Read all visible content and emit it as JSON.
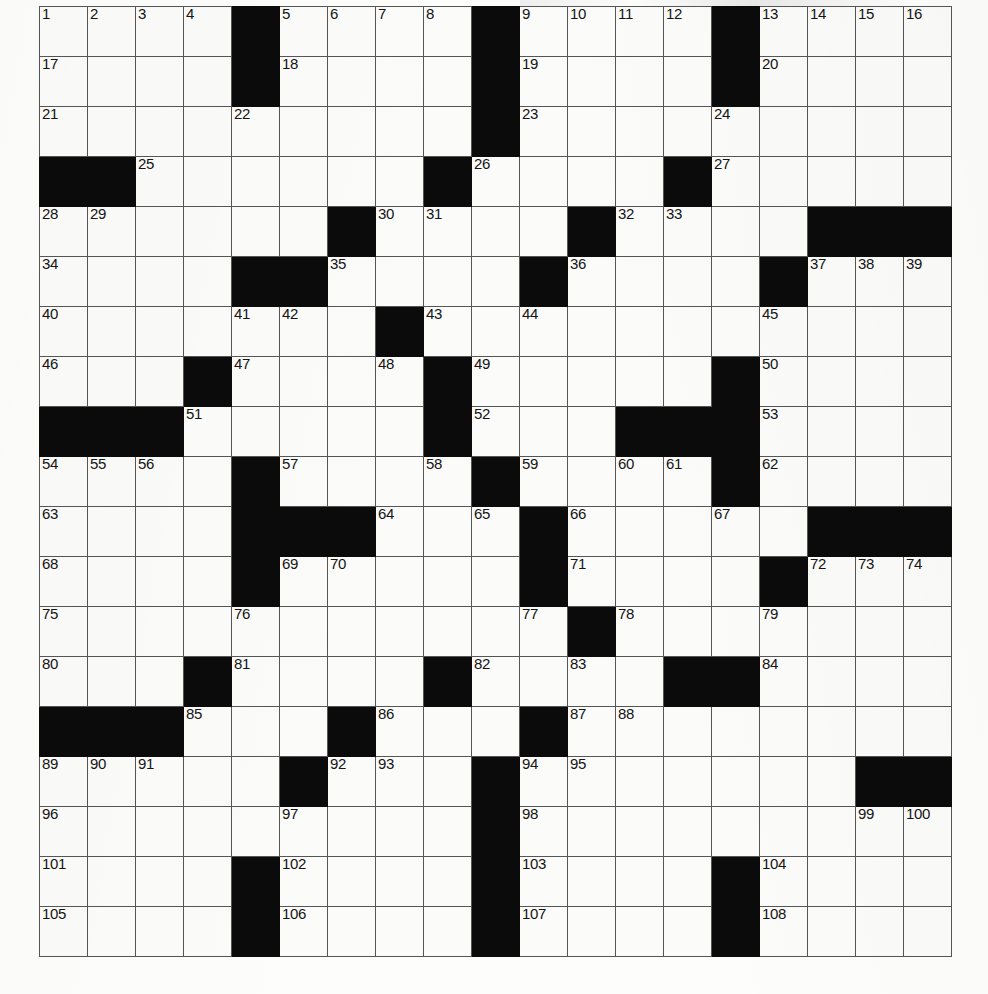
{
  "puzzle": {
    "type": "crossword-grid",
    "rows": 19,
    "columns": 19,
    "cell_count": 361,
    "colors": {
      "block": "#0b0b0b",
      "cell": "#fbfbf9",
      "grid_line": "#555555",
      "number_text": "#141414",
      "page": "#ffffff"
    },
    "highest_clue_number": 108,
    "grid": [
      [
        {
          "n": "1"
        },
        {
          "n": "2"
        },
        {
          "n": "3"
        },
        {
          "n": "4"
        },
        {
          "b": true
        },
        {
          "n": "5"
        },
        {
          "n": "6"
        },
        {
          "n": "7"
        },
        {
          "n": "8"
        },
        {
          "b": true
        },
        {
          "n": "9"
        },
        {
          "n": "10"
        },
        {
          "n": "11"
        },
        {
          "n": "12"
        },
        {
          "b": true
        },
        {
          "n": "13"
        },
        {
          "n": "14"
        },
        {
          "n": "15"
        },
        {
          "n": "16"
        }
      ],
      [
        {
          "n": "17"
        },
        {},
        {},
        {},
        {
          "b": true
        },
        {
          "n": "18"
        },
        {},
        {},
        {},
        {
          "b": true
        },
        {
          "n": "19"
        },
        {},
        {},
        {},
        {
          "b": true
        },
        {
          "n": "20"
        },
        {},
        {},
        {}
      ],
      [
        {
          "n": "21"
        },
        {},
        {},
        {},
        {
          "n": "22"
        },
        {},
        {},
        {},
        {},
        {
          "b": true
        },
        {
          "n": "23"
        },
        {},
        {},
        {},
        {
          "n": "24"
        },
        {},
        {},
        {},
        {}
      ],
      [
        {
          "b": true
        },
        {
          "b": true
        },
        {
          "n": "25"
        },
        {},
        {},
        {},
        {},
        {},
        {
          "b": true
        },
        {
          "n": "26"
        },
        {},
        {},
        {},
        {
          "b": true
        },
        {
          "n": "27"
        },
        {},
        {},
        {},
        {}
      ],
      [
        {
          "n": "28"
        },
        {
          "n": "29"
        },
        {},
        {},
        {},
        {},
        {
          "b": true
        },
        {
          "n": "30"
        },
        {
          "n": "31"
        },
        {},
        {},
        {
          "b": true
        },
        {
          "n": "32"
        },
        {
          "n": "33"
        },
        {},
        {},
        {
          "b": true
        },
        {
          "b": true
        },
        {
          "b": true
        }
      ],
      [
        {
          "n": "34"
        },
        {},
        {},
        {},
        {
          "b": true
        },
        {
          "b": true
        },
        {
          "n": "35"
        },
        {},
        {},
        {},
        {
          "b": true
        },
        {
          "n": "36"
        },
        {},
        {},
        {},
        {
          "b": true
        },
        {
          "n": "37"
        },
        {
          "n": "38"
        },
        {
          "n": "39"
        }
      ],
      [
        {
          "n": "40"
        },
        {},
        {},
        {},
        {
          "n": "41"
        },
        {
          "n": "42"
        },
        {},
        {
          "b": true
        },
        {
          "n": "43"
        },
        {},
        {
          "n": "44"
        },
        {},
        {},
        {},
        {},
        {
          "n": "45"
        },
        {},
        {},
        {}
      ],
      [
        {
          "n": "46"
        },
        {},
        {},
        {
          "b": true
        },
        {
          "n": "47"
        },
        {},
        {},
        {
          "n": "48"
        },
        {
          "b": true
        },
        {
          "n": "49"
        },
        {},
        {},
        {},
        {},
        {
          "b": true
        },
        {
          "n": "50"
        },
        {},
        {},
        {}
      ],
      [
        {
          "b": true
        },
        {
          "b": true
        },
        {
          "b": true
        },
        {
          "n": "51"
        },
        {},
        {},
        {},
        {},
        {
          "b": true
        },
        {
          "n": "52"
        },
        {},
        {},
        {
          "b": true
        },
        {
          "b": true
        },
        {
          "b": true
        },
        {
          "n": "53"
        },
        {},
        {},
        {}
      ],
      [
        {
          "n": "54"
        },
        {
          "n": "55"
        },
        {
          "n": "56"
        },
        {},
        {
          "b": true
        },
        {
          "n": "57"
        },
        {},
        {},
        {
          "n": "58"
        },
        {
          "b": true
        },
        {
          "n": "59"
        },
        {},
        {
          "n": "60"
        },
        {
          "n": "61"
        },
        {
          "b": true
        },
        {
          "n": "62"
        },
        {},
        {},
        {}
      ],
      [
        {
          "n": "63"
        },
        {},
        {},
        {},
        {
          "b": true
        },
        {
          "b": true
        },
        {
          "b": true
        },
        {
          "n": "64"
        },
        {},
        {
          "n": "65"
        },
        {
          "b": true
        },
        {
          "n": "66"
        },
        {},
        {},
        {
          "n": "67"
        },
        {},
        {
          "b": true
        },
        {
          "b": true
        },
        {
          "b": true
        }
      ],
      [
        {
          "n": "68"
        },
        {},
        {},
        {},
        {
          "b": true
        },
        {
          "n": "69"
        },
        {
          "n": "70"
        },
        {},
        {},
        {},
        {
          "b": true
        },
        {
          "n": "71"
        },
        {},
        {},
        {},
        {
          "b": true
        },
        {
          "n": "72"
        },
        {
          "n": "73"
        },
        {
          "n": "74"
        }
      ],
      [
        {
          "n": "75"
        },
        {},
        {},
        {},
        {
          "n": "76"
        },
        {},
        {},
        {},
        {},
        {},
        {
          "n": "77"
        },
        {
          "b": true
        },
        {
          "n": "78"
        },
        {},
        {},
        {
          "n": "79"
        },
        {},
        {},
        {}
      ],
      [
        {
          "n": "80"
        },
        {},
        {},
        {
          "b": true
        },
        {
          "n": "81"
        },
        {},
        {},
        {},
        {
          "b": true
        },
        {
          "n": "82"
        },
        {},
        {
          "n": "83"
        },
        {},
        {
          "b": true
        },
        {
          "b": true
        },
        {
          "n": "84"
        },
        {},
        {},
        {}
      ],
      [
        {
          "b": true
        },
        {
          "b": true
        },
        {
          "b": true
        },
        {
          "n": "85"
        },
        {},
        {},
        {
          "b": true
        },
        {
          "n": "86"
        },
        {},
        {},
        {
          "b": true
        },
        {
          "n": "87"
        },
        {
          "n": "88"
        },
        {},
        {},
        {},
        {},
        {},
        {}
      ],
      [
        {
          "n": "89"
        },
        {
          "n": "90"
        },
        {
          "n": "91"
        },
        {},
        {},
        {
          "b": true
        },
        {
          "n": "92"
        },
        {
          "n": "93"
        },
        {},
        {
          "b": true
        },
        {
          "n": "94"
        },
        {
          "n": "95"
        },
        {},
        {},
        {},
        {},
        {},
        {
          "b": true
        },
        {
          "b": true
        }
      ],
      [
        {
          "n": "96"
        },
        {},
        {},
        {},
        {},
        {
          "n": "97"
        },
        {},
        {},
        {},
        {
          "b": true
        },
        {
          "n": "98"
        },
        {},
        {},
        {},
        {},
        {},
        {},
        {
          "n": "99"
        },
        {
          "n": "100"
        }
      ],
      [
        {
          "n": "101"
        },
        {},
        {},
        {},
        {
          "b": true
        },
        {
          "n": "102"
        },
        {},
        {},
        {},
        {
          "b": true
        },
        {
          "n": "103"
        },
        {},
        {},
        {},
        {
          "b": true
        },
        {
          "n": "104"
        },
        {},
        {},
        {}
      ],
      [
        {
          "n": "105"
        },
        {},
        {},
        {},
        {
          "b": true
        },
        {
          "n": "106"
        },
        {},
        {},
        {},
        {
          "b": true
        },
        {
          "n": "107"
        },
        {},
        {},
        {},
        {
          "b": true
        },
        {
          "n": "108"
        },
        {},
        {},
        {}
      ]
    ]
  }
}
